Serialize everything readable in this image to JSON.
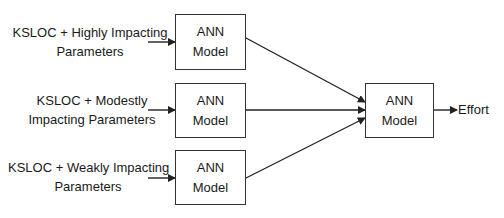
{
  "diagram": {
    "inputs": [
      {
        "line1": "KSLOC + Highly Impacting",
        "line2": "Parameters"
      },
      {
        "line1": "KSLOC + Modestly",
        "line2": "Impacting Parameters"
      },
      {
        "line1": "KSLOC + Weakly Impacting",
        "line2": "Parameters"
      }
    ],
    "models": [
      {
        "line1": "ANN",
        "line2": "Model"
      },
      {
        "line1": "ANN",
        "line2": "Model"
      },
      {
        "line1": "ANN",
        "line2": "Model"
      }
    ],
    "final_model": {
      "line1": "ANN",
      "line2": "Model"
    },
    "output": "Effort"
  }
}
